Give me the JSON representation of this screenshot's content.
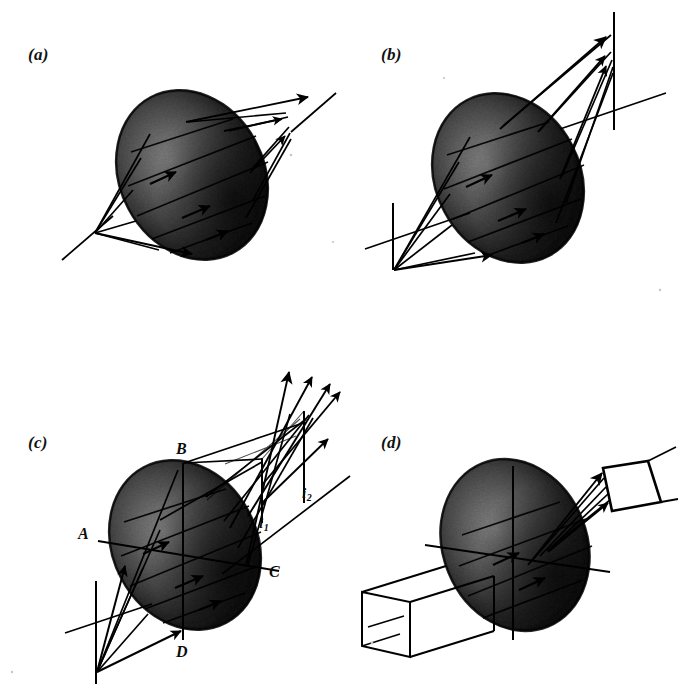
{
  "figure": {
    "background_color": "#ffffff",
    "ink_color": "#000000",
    "width": 680,
    "height": 684
  },
  "panels": [
    {
      "key": "a",
      "label": "(a)",
      "caption_text": "(a)",
      "description": "Rays converging from a lower-left focal point through the ellipsoid to an upper-right focal point"
    },
    {
      "key": "b",
      "label": "(b)",
      "caption_text": "(b)",
      "description": "Object plane at lower left and image plane at upper right, both crossed by the optical axis"
    },
    {
      "key": "c",
      "label": "(c)",
      "caption_text": "(c)",
      "description": "Labelled axes A, B, C, D on the ellipsoid with two image planes i1 and i2"
    },
    {
      "key": "d",
      "label": "(d)",
      "caption_text": "(d)",
      "description": "Rectangular input beam tube and tilted output aperture quadrilateral"
    }
  ],
  "labels": {
    "axis_a": "A",
    "axis_b": "B",
    "axis_c": "C",
    "axis_d": "D",
    "image_i1_base": "i",
    "image_i1_sub": "1",
    "image_i2_base": "i",
    "image_i2_sub": "2"
  },
  "colors": {
    "ink": "#000000",
    "paper": "#ffffff",
    "lens_dark": "#1a1a1a",
    "lens_mid": "#4a4a4a",
    "lens_light": "#8e8e8e",
    "lens_edge": "#050505",
    "speck": "#b8b8b8"
  },
  "geometry": {
    "ellipsoid_rotation_deg": -28,
    "panel_a_center": [
      192,
      175
    ],
    "panel_b_center": [
      508,
      178
    ],
    "panel_c_center": [
      185,
      545
    ],
    "panel_d_center": [
      515,
      545
    ]
  }
}
